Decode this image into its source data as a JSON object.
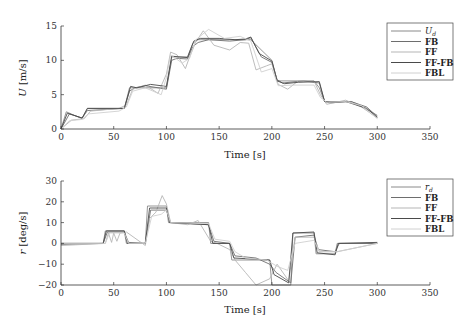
{
  "chart_data": [
    {
      "type": "line",
      "title": "",
      "xlabel": "Time [s]",
      "ylabel": "U [m/s]",
      "ylabel_symbol": "U",
      "ylabel_unit": "[m/s]",
      "xlim": [
        0,
        350
      ],
      "ylim": [
        0,
        15
      ],
      "xticks": [
        0,
        50,
        100,
        150,
        200,
        250,
        300,
        350
      ],
      "yticks": [
        0,
        5,
        10,
        15
      ],
      "grid": false,
      "legend_position": "upper right",
      "legend": [
        "U_d",
        "FB",
        "FF",
        "FF-FB",
        "FBL"
      ],
      "series": [
        {
          "name": "U_d",
          "color": "#8a8a8a",
          "x": [
            0,
            5,
            20,
            25,
            60,
            65,
            70,
            100,
            105,
            120,
            125,
            130,
            175,
            180,
            200,
            205,
            240,
            245,
            250,
            265,
            275,
            280,
            300
          ],
          "y": [
            0,
            2.5,
            1.5,
            3,
            3,
            6,
            6,
            6,
            10.5,
            10.5,
            12.5,
            13,
            13,
            13,
            10,
            7,
            7,
            6,
            4,
            4,
            4,
            3.7,
            2
          ]
        },
        {
          "name": "FB",
          "color": "#6e6e6e",
          "x": [
            0,
            8,
            20,
            25,
            60,
            65,
            70,
            80,
            100,
            105,
            110,
            120,
            125,
            130,
            140,
            160,
            175,
            180,
            190,
            200,
            205,
            210,
            230,
            245,
            250,
            255,
            275,
            290,
            300
          ],
          "y": [
            0,
            2.2,
            1.6,
            2.7,
            3,
            5.5,
            6,
            6.3,
            5.8,
            10,
            10.3,
            10.2,
            12,
            12.6,
            13,
            12.8,
            13,
            13.3,
            10.5,
            9.7,
            7.2,
            6.7,
            7,
            6.7,
            4,
            3.8,
            4,
            3.2,
            1.8
          ]
        },
        {
          "name": "FF",
          "color": "#b5b5b5",
          "x": [
            0,
            10,
            22,
            28,
            55,
            62,
            68,
            80,
            92,
            100,
            104,
            110,
            118,
            122,
            128,
            135,
            145,
            160,
            170,
            178,
            185,
            195,
            200,
            206,
            215,
            225,
            240,
            246,
            252,
            270,
            285,
            300
          ],
          "y": [
            0,
            1.3,
            1.5,
            2.6,
            3,
            3.5,
            5.8,
            6.4,
            5.2,
            8,
            11.2,
            10.8,
            8.8,
            10.5,
            12.7,
            14.3,
            12.2,
            11.5,
            12.6,
            12.5,
            8.6,
            9.2,
            9.5,
            6.5,
            5.8,
            7,
            7,
            5,
            3.6,
            4.2,
            3.2,
            1.6
          ]
        },
        {
          "name": "FF-FB",
          "color": "#4a4a4a",
          "x": [
            0,
            6,
            20,
            25,
            60,
            66,
            72,
            85,
            100,
            105,
            112,
            120,
            126,
            132,
            150,
            165,
            175,
            180,
            188,
            200,
            205,
            212,
            225,
            245,
            250,
            256,
            270,
            290,
            300
          ],
          "y": [
            0,
            2.3,
            1.6,
            3,
            3,
            6.2,
            6,
            6.5,
            6.2,
            10.6,
            10.5,
            10.4,
            12.8,
            13.2,
            13.2,
            13,
            13.1,
            13.4,
            11,
            9.9,
            7,
            6.6,
            6.8,
            6.9,
            4,
            3.9,
            4,
            3,
            1.7
          ]
        },
        {
          "name": "FBL",
          "color": "#d0d0d0",
          "x": [
            0,
            8,
            20,
            26,
            55,
            62,
            68,
            80,
            95,
            100,
            104,
            115,
            122,
            128,
            140,
            155,
            170,
            180,
            190,
            200,
            206,
            220,
            240,
            246,
            252,
            270,
            285,
            300
          ],
          "y": [
            0,
            1.2,
            1.4,
            2.2,
            2.6,
            3.2,
            5.5,
            6,
            5,
            7.5,
            10.8,
            9.6,
            10.3,
            13,
            14.5,
            13.2,
            13.5,
            12.8,
            8.3,
            8.8,
            6.3,
            6.4,
            6.4,
            4.6,
            3.9,
            4,
            3.4,
            1.5
          ]
        }
      ]
    },
    {
      "type": "line",
      "title": "",
      "xlabel": "Time [s]",
      "ylabel": "r [deg/s]",
      "ylabel_symbol": "r",
      "ylabel_unit": "[deg/s]",
      "xlim": [
        0,
        350
      ],
      "ylim": [
        -20,
        30
      ],
      "xticks": [
        0,
        50,
        100,
        150,
        200,
        250,
        300,
        350
      ],
      "yticks": [
        -20,
        -10,
        0,
        10,
        20,
        30
      ],
      "grid": false,
      "legend_position": "upper right",
      "legend": [
        "r_d",
        "FB",
        "FF",
        "FF-FB",
        "FBL"
      ],
      "series": [
        {
          "name": "r_d",
          "color": "#8a8a8a",
          "x": [
            0,
            40,
            42,
            60,
            62,
            80,
            82,
            100,
            102,
            140,
            142,
            160,
            162,
            198,
            200,
            218,
            220,
            240,
            242,
            260,
            262,
            300
          ],
          "y": [
            0,
            0,
            6,
            6,
            0,
            0,
            18,
            18,
            10,
            10,
            0,
            0,
            -8,
            -8,
            -20,
            -20,
            5,
            5,
            -5,
            -5,
            0,
            0
          ]
        },
        {
          "name": "FB",
          "color": "#6e6e6e",
          "x": [
            0,
            40,
            44,
            60,
            64,
            80,
            85,
            100,
            104,
            140,
            145,
            160,
            165,
            185,
            198,
            204,
            218,
            222,
            240,
            244,
            260,
            264,
            300
          ],
          "y": [
            -0.5,
            0,
            5.5,
            5.5,
            0.5,
            0,
            16,
            16,
            10,
            9,
            1,
            0,
            -6,
            -7,
            -10,
            -14,
            -19,
            3,
            4,
            -3,
            -4,
            0,
            0
          ]
        },
        {
          "name": "FF",
          "color": "#b5b5b5",
          "x": [
            0,
            42,
            45,
            48,
            50,
            53,
            56,
            62,
            80,
            84,
            90,
            96,
            100,
            104,
            120,
            130,
            142,
            148,
            160,
            165,
            175,
            185,
            198,
            205,
            216,
            222,
            240,
            245,
            262,
            300
          ],
          "y": [
            -1,
            0,
            5,
            0.5,
            5,
            1,
            5,
            5.5,
            -1,
            12,
            15,
            23,
            19,
            10,
            9,
            11,
            1,
            0,
            -3,
            -8,
            -14,
            -20,
            -17,
            -10,
            -18,
            3,
            3,
            -4,
            -4,
            0
          ]
        },
        {
          "name": "FF-FB",
          "color": "#4a4a4a",
          "x": [
            0,
            40,
            43,
            60,
            63,
            80,
            84,
            100,
            103,
            140,
            144,
            160,
            164,
            198,
            202,
            216,
            220,
            240,
            243,
            260,
            263,
            300
          ],
          "y": [
            0,
            0,
            6,
            6,
            0,
            0,
            17,
            17,
            10,
            9,
            0,
            0,
            -7,
            -8,
            -15,
            -19,
            5,
            5.5,
            -4.5,
            -5.5,
            0,
            0.5
          ]
        },
        {
          "name": "FBL",
          "color": "#d0d0d0",
          "x": [
            0,
            42,
            46,
            60,
            64,
            80,
            86,
            95,
            100,
            104,
            140,
            146,
            160,
            165,
            175,
            195,
            205,
            215,
            222,
            240,
            245,
            262,
            300
          ],
          "y": [
            0,
            0,
            5,
            5,
            0,
            0,
            13,
            14,
            16,
            10,
            9.5,
            2,
            1,
            -4,
            -7,
            -8,
            -11,
            -13,
            0,
            1.5,
            -4,
            -4,
            0
          ]
        }
      ]
    }
  ]
}
